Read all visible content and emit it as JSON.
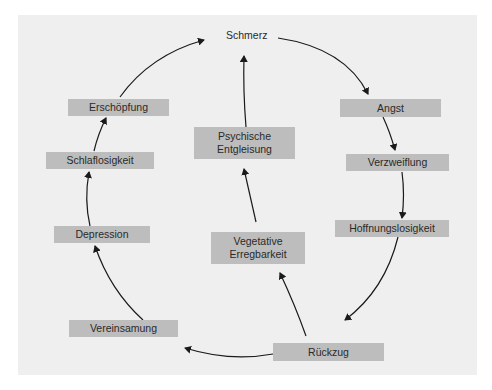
{
  "diagram": {
    "type": "cycle",
    "nodes": {
      "schmerz": "Schmerz",
      "angst": "Angst",
      "verzweiflung": "Verzweiflung",
      "hoffnungslosigkeit": "Hoffnungslosigkeit",
      "rueckzug": "Rückzug",
      "vereinsamung": "Vereinsamung",
      "depression": "Depression",
      "schlaflosigkeit": "Schlaflosigkeit",
      "erschoepfung": "Erschöpfung",
      "vegetative_line1": "Vegetative",
      "vegetative_line2": "Erregbarkeit",
      "psychische_line1": "Psychische",
      "psychische_line2": "Entgleisung"
    },
    "edges": [
      [
        "Schmerz",
        "Angst"
      ],
      [
        "Angst",
        "Verzweiflung"
      ],
      [
        "Verzweiflung",
        "Hoffnungslosigkeit"
      ],
      [
        "Hoffnungslosigkeit",
        "Rückzug"
      ],
      [
        "Rückzug",
        "Vereinsamung"
      ],
      [
        "Vereinsamung",
        "Depression"
      ],
      [
        "Depression",
        "Schlaflosigkeit"
      ],
      [
        "Schlaflosigkeit",
        "Erschöpfung"
      ],
      [
        "Erschöpfung",
        "Schmerz"
      ],
      [
        "Rückzug",
        "Vegetative Erregbarkeit"
      ],
      [
        "Vegetative Erregbarkeit",
        "Psychische Entgleisung"
      ],
      [
        "Psychische Entgleisung",
        "Schmerz"
      ]
    ],
    "colors": {
      "panel": "#efefef",
      "box": "#bdbdbd",
      "text": "#2a2a2a",
      "arrow": "#1a1a1a"
    }
  }
}
